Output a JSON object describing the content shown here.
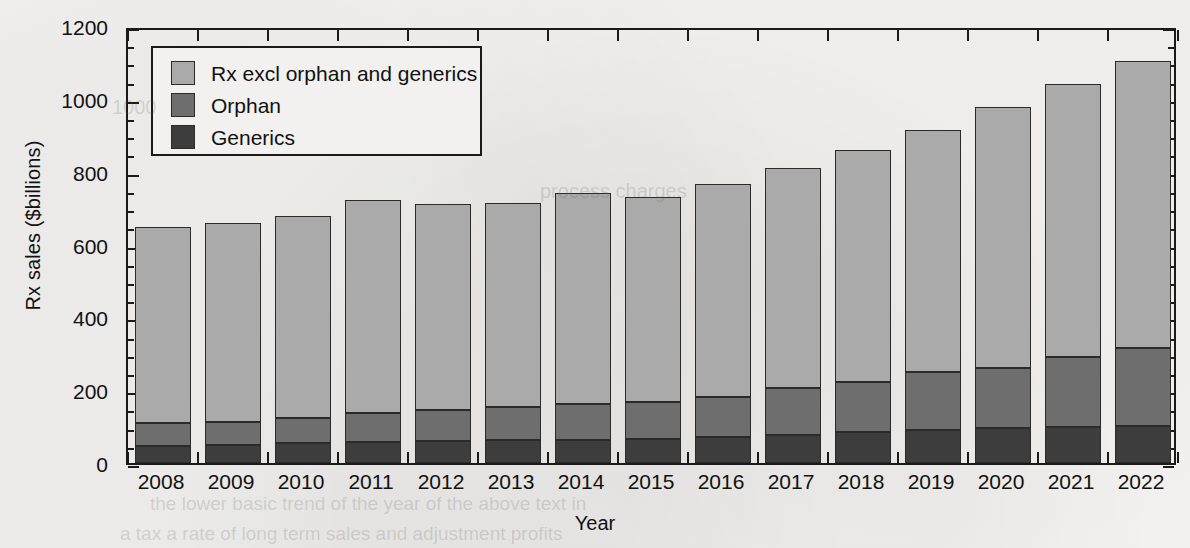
{
  "chart_data": {
    "type": "bar",
    "stacked": true,
    "title": "",
    "xlabel": "Year",
    "ylabel": "Rx sales ($billions)",
    "ylim": [
      0,
      1200
    ],
    "ytick_step": 200,
    "yminor_step": 50,
    "grid": false,
    "legend_position": "upper left",
    "yticks": [
      "0",
      "200",
      "400",
      "600",
      "800",
      "1000",
      "1200"
    ],
    "categories": [
      "2008",
      "2009",
      "2010",
      "2011",
      "2012",
      "2013",
      "2014",
      "2015",
      "2016",
      "2017",
      "2018",
      "2019",
      "2020",
      "2021",
      "2022"
    ],
    "series": [
      {
        "name": "Generics",
        "color": "#3d3d3d",
        "values": [
          48,
          49,
          54,
          58,
          60,
          62,
          64,
          67,
          71,
          78,
          85,
          90,
          95,
          100,
          102
        ]
      },
      {
        "name": "Orphan",
        "color": "#6e6e6e",
        "values": [
          62,
          64,
          70,
          80,
          85,
          92,
          98,
          101,
          109,
          127,
          138,
          160,
          166,
          190,
          213
        ]
      },
      {
        "name": "Rx excl orphan and generics",
        "color": "#aaaaaa",
        "values": [
          537,
          546,
          554,
          584,
          565,
          560,
          580,
          563,
          585,
          605,
          637,
          665,
          717,
          752,
          790
        ]
      }
    ],
    "stack_tops": {
      "generics": [
        48,
        49,
        54,
        58,
        60,
        62,
        64,
        67,
        71,
        78,
        85,
        90,
        95,
        100,
        102
      ],
      "orphan": [
        110,
        113,
        124,
        138,
        145,
        154,
        162,
        168,
        180,
        205,
        223,
        250,
        261,
        290,
        315
      ],
      "total": [
        647,
        659,
        678,
        722,
        710,
        714,
        742,
        731,
        765,
        810,
        860,
        915,
        978,
        1042,
        1105
      ]
    }
  },
  "legend": {
    "items": [
      {
        "label": "Rx excl orphan and generics",
        "color": "#aaaaaa"
      },
      {
        "label": "Orphan",
        "color": "#6e6e6e"
      },
      {
        "label": "Generics",
        "color": "#3d3d3d"
      }
    ]
  },
  "ghost_text": [
    {
      "text": "1000",
      "x": 112,
      "y": 96,
      "size": 20
    },
    {
      "text": "process charges",
      "x": 540,
      "y": 180,
      "size": 20
    },
    {
      "text": "the lower basic trend of the year of the above text in",
      "x": 150,
      "y": 493,
      "size": 19
    },
    {
      "text": "a tax a rate of long term sales and adjustment profits",
      "x": 120,
      "y": 523,
      "size": 19
    }
  ]
}
